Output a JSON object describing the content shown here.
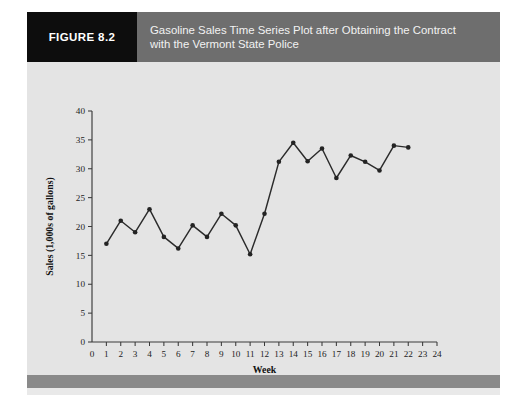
{
  "figure": {
    "number_label": "FIGURE 8.2",
    "title_line1": "Gasoline Sales Time Series Plot after Obtaining the Contract",
    "title_line2": "with the Vermont State Police",
    "title_full": "Gasoline Sales Time Series Plot after Obtaining the Contract with the Vermont State Police",
    "colors": {
      "number_box": "#0d0d0d",
      "title_bar": "#6e6e6e",
      "panel_background": "#e9e9e9",
      "plot_background": "#e4e4e4",
      "footer_bar": "#8a8a8a",
      "line": "#2b2b2b",
      "marker": "#232323",
      "axis": "#3a3a3a"
    }
  },
  "chart_data": {
    "type": "line",
    "title": "",
    "xlabel": "Week",
    "ylabel": "Sales (1,000s of gallons)",
    "xlim": [
      0,
      24
    ],
    "ylim": [
      0,
      40
    ],
    "xticks": [
      0,
      1,
      2,
      3,
      4,
      5,
      6,
      7,
      8,
      9,
      10,
      11,
      12,
      13,
      14,
      15,
      16,
      17,
      18,
      19,
      20,
      21,
      22,
      23,
      24
    ],
    "yticks": [
      0,
      5,
      10,
      15,
      20,
      25,
      30,
      35,
      40
    ],
    "xtick_labels": [
      "0",
      "1",
      "2",
      "3",
      "4",
      "5",
      "6",
      "7",
      "8",
      "9",
      "10",
      "11",
      "12",
      "13",
      "14",
      "15",
      "16",
      "17",
      "18",
      "19",
      "20",
      "21",
      "22",
      "23",
      "24"
    ],
    "ytick_labels": [
      "0",
      "5",
      "10",
      "15",
      "20",
      "25",
      "30",
      "35",
      "40"
    ],
    "grid": false,
    "legend": false,
    "markers": true,
    "x": [
      1,
      2,
      3,
      4,
      5,
      6,
      7,
      8,
      9,
      10,
      11,
      12,
      13,
      14,
      15,
      16,
      17,
      18,
      19,
      20,
      21,
      22
    ],
    "values": [
      17.0,
      21.0,
      19.0,
      23.0,
      18.2,
      16.2,
      20.2,
      18.2,
      22.2,
      20.2,
      15.2,
      22.2,
      31.2,
      34.5,
      31.3,
      33.5,
      28.4,
      32.3,
      31.2,
      29.7,
      34.0,
      33.7
    ],
    "series": [
      {
        "name": "Gasoline Sales",
        "values": [
          17.0,
          21.0,
          19.0,
          23.0,
          18.2,
          16.2,
          20.2,
          18.2,
          22.2,
          20.2,
          15.2,
          22.2,
          31.2,
          34.5,
          31.3,
          33.5,
          28.4,
          32.3,
          31.2,
          29.7,
          34.0,
          33.7
        ]
      }
    ]
  }
}
